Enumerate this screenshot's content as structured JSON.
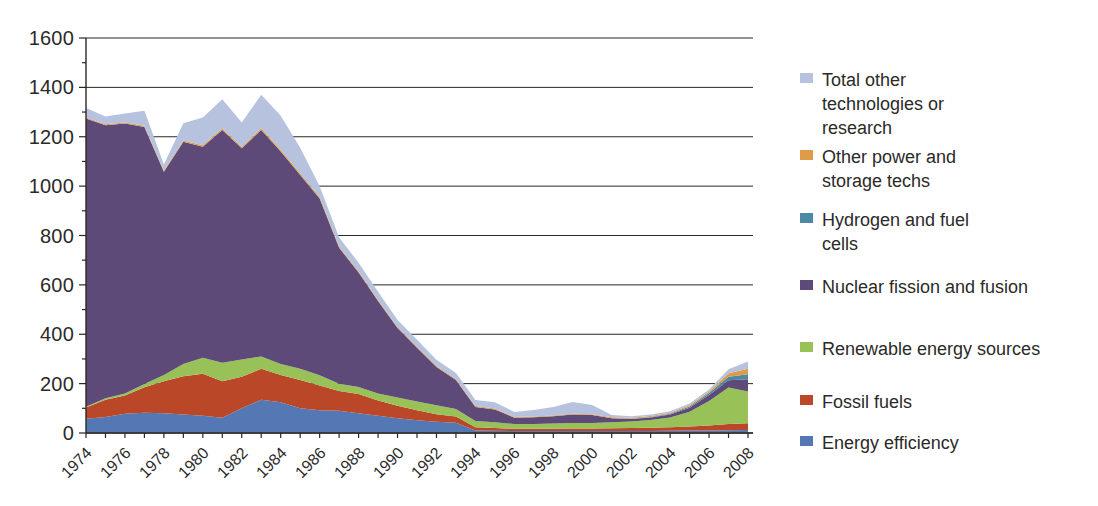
{
  "chart_data": {
    "type": "area",
    "stacked": true,
    "x": [
      1974,
      1975,
      1976,
      1977,
      1978,
      1979,
      1980,
      1981,
      1982,
      1983,
      1984,
      1985,
      1986,
      1987,
      1988,
      1989,
      1990,
      1991,
      1992,
      1993,
      1994,
      1995,
      1996,
      1997,
      1998,
      1999,
      2000,
      2001,
      2002,
      2003,
      2004,
      2005,
      2006,
      2007,
      2008
    ],
    "x_label_step": 2,
    "ylim": [
      0,
      1600
    ],
    "y_ticks": [
      0,
      200,
      400,
      600,
      800,
      1000,
      1200,
      1400,
      1600
    ],
    "y_minor_step": 100,
    "grid": "horizontal",
    "legend_position": "right",
    "series": [
      {
        "key": "energy-efficiency",
        "name": "Energy efficiency",
        "color": "#5478b4",
        "values": [
          58,
          65,
          78,
          82,
          80,
          75,
          70,
          62,
          100,
          135,
          125,
          100,
          92,
          90,
          80,
          70,
          60,
          52,
          46,
          42,
          10,
          9,
          8,
          8,
          8,
          8,
          8,
          8,
          8,
          8,
          9,
          10,
          10,
          11,
          12
        ]
      },
      {
        "key": "fossil-fuels",
        "name": "Fossil fuels",
        "color": "#bb4729",
        "values": [
          45,
          70,
          74,
          103,
          130,
          155,
          170,
          148,
          128,
          125,
          110,
          115,
          100,
          80,
          78,
          62,
          50,
          40,
          30,
          25,
          13,
          11,
          9,
          9,
          9,
          10,
          10,
          11,
          12,
          13,
          14,
          16,
          20,
          25,
          28
        ]
      },
      {
        "key": "renewable-energy-sources",
        "name": "Renewable energy sources",
        "color": "#98c158",
        "values": [
          3,
          6,
          8,
          13,
          25,
          50,
          65,
          75,
          70,
          50,
          45,
          45,
          42,
          30,
          28,
          28,
          34,
          36,
          36,
          30,
          26,
          24,
          19,
          19,
          21,
          23,
          23,
          25,
          27,
          32,
          40,
          60,
          100,
          148,
          128
        ]
      },
      {
        "key": "nuclear-fission-fusion",
        "name": "Nuclear fission and fusion",
        "color": "#5d4a78",
        "values": [
          1168,
          1106,
          1094,
          1042,
          823,
          900,
          855,
          942,
          855,
          917,
          860,
          785,
          716,
          550,
          464,
          375,
          281,
          217,
          155,
          118,
          56,
          51,
          26,
          28,
          30,
          34,
          32,
          16,
          10,
          10,
          12,
          16,
          24,
          30,
          50
        ]
      },
      {
        "key": "hydrogen-fuel-cells",
        "name": "Hydrogen and fuel cells",
        "color": "#4d89a5",
        "values": [
          0,
          0,
          0,
          0,
          0,
          0,
          0,
          0,
          0,
          0,
          0,
          0,
          0,
          0,
          0,
          0,
          0,
          0,
          0,
          0,
          0,
          0,
          0,
          0,
          0,
          0,
          0,
          0,
          1,
          2,
          3,
          5,
          8,
          14,
          20
        ]
      },
      {
        "key": "other-power-storage",
        "name": "Other power and storage techs",
        "color": "#de9b48",
        "values": [
          4,
          4,
          4,
          5,
          5,
          5,
          6,
          6,
          6,
          7,
          7,
          7,
          6,
          5,
          5,
          4,
          4,
          4,
          4,
          4,
          4,
          4,
          3,
          3,
          3,
          3,
          3,
          4,
          4,
          4,
          4,
          5,
          6,
          14,
          22
        ]
      },
      {
        "key": "total-other-technologies",
        "name": "Total other technologies or research",
        "color": "#b6c2de",
        "values": [
          38,
          31,
          36,
          60,
          25,
          70,
          112,
          119,
          99,
          136,
          138,
          103,
          44,
          37,
          35,
          33,
          29,
          29,
          26,
          24,
          25,
          26,
          20,
          26,
          34,
          48,
          37,
          9,
          6,
          6,
          6,
          8,
          8,
          16,
          30
        ]
      }
    ],
    "legend": {
      "items": [
        {
          "key": "total-other-technologies",
          "lines": [
            "Total other",
            "technologies or",
            "research"
          ]
        },
        {
          "key": "other-power-storage",
          "lines": [
            "Other power and",
            "storage techs"
          ]
        },
        {
          "key": "hydrogen-fuel-cells",
          "lines": [
            "Hydrogen and fuel",
            "cells"
          ]
        },
        {
          "key": "nuclear-fission-fusion",
          "lines": [
            "Nuclear fission and fusion"
          ]
        },
        {
          "key": "renewable-energy-sources",
          "lines": [
            "Renewable energy sources"
          ]
        },
        {
          "key": "fossil-fuels",
          "lines": [
            "Fossil fuels"
          ]
        },
        {
          "key": "energy-efficiency",
          "lines": [
            "Energy efficiency"
          ]
        }
      ]
    },
    "axis_color": "#2b2723"
  }
}
